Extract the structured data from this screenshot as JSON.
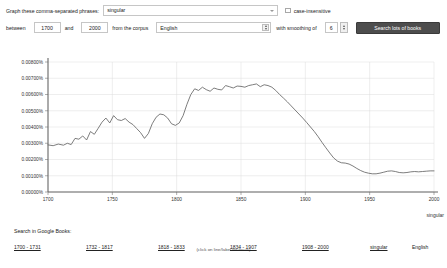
{
  "form": {
    "phrase_label": "Graph these comma-separated phrases:",
    "phrase_value": "singular",
    "phrase_placeholder": "singular",
    "case_insensitive_label": "case-insensitive",
    "between_label": "between",
    "start_year": "1700",
    "and_label": "and",
    "end_year": "2000",
    "corpus_label": "from the corpus",
    "corpus_value": "English",
    "smoothing_label": "with smoothing of",
    "smoothing_value": "6",
    "search_button_label": "Search lots of books"
  },
  "chart_data": {
    "type": "line",
    "title": "",
    "xlabel": "",
    "ylabel": "",
    "caption": "(click on line/label for focus)",
    "series_label": "singular",
    "grid": true,
    "legend_position": "right",
    "xlim": [
      1700,
      2000
    ],
    "ylim": [
      0.0,
      0.008
    ],
    "xticks": [
      "1700",
      "1750",
      "1800",
      "1850",
      "1900",
      "1950",
      "2000"
    ],
    "yticks": [
      "0.00000%",
      "0.00100%",
      "0.00200%",
      "0.00300%",
      "0.00400%",
      "0.00500%",
      "0.00600%",
      "0.00700%",
      "0.00800%"
    ],
    "series": [
      {
        "name": "singular",
        "color": "#666666",
        "x": [
          1700,
          1704,
          1708,
          1712,
          1715,
          1718,
          1721,
          1724,
          1727,
          1730,
          1733,
          1736,
          1739,
          1742,
          1745,
          1748,
          1751,
          1754,
          1757,
          1760,
          1763,
          1766,
          1769,
          1772,
          1775,
          1778,
          1781,
          1784,
          1787,
          1790,
          1793,
          1796,
          1799,
          1802,
          1805,
          1808,
          1811,
          1814,
          1817,
          1820,
          1823,
          1826,
          1829,
          1832,
          1835,
          1838,
          1841,
          1844,
          1847,
          1850,
          1853,
          1856,
          1859,
          1862,
          1865,
          1868,
          1871,
          1874,
          1877,
          1880,
          1883,
          1886,
          1889,
          1892,
          1895,
          1898,
          1901,
          1904,
          1907,
          1910,
          1913,
          1916,
          1919,
          1922,
          1925,
          1928,
          1931,
          1934,
          1937,
          1940,
          1943,
          1946,
          1949,
          1952,
          1955,
          1958,
          1961,
          1964,
          1967,
          1970,
          1973,
          1976,
          1979,
          1982,
          1985,
          1988,
          1991,
          1994,
          1997,
          2000
        ],
        "values": [
          0.0029,
          0.00285,
          0.00295,
          0.00288,
          0.003,
          0.00292,
          0.0033,
          0.00325,
          0.00345,
          0.0032,
          0.00372,
          0.00355,
          0.00392,
          0.0043,
          0.00455,
          0.00425,
          0.0047,
          0.00445,
          0.0044,
          0.00452,
          0.0043,
          0.00415,
          0.0039,
          0.00365,
          0.0033,
          0.0036,
          0.0042,
          0.0046,
          0.0048,
          0.00475,
          0.00455,
          0.0042,
          0.0041,
          0.00425,
          0.0047,
          0.0054,
          0.006,
          0.00635,
          0.00625,
          0.00645,
          0.0063,
          0.0062,
          0.0064,
          0.00632,
          0.00628,
          0.00655,
          0.00648,
          0.0064,
          0.00652,
          0.0065,
          0.00645,
          0.00655,
          0.0066,
          0.00665,
          0.00648,
          0.0066,
          0.00655,
          0.00645,
          0.00625,
          0.006,
          0.00578,
          0.00555,
          0.0053,
          0.00505,
          0.0048,
          0.00455,
          0.00428,
          0.004,
          0.00372,
          0.0034,
          0.00305,
          0.00272,
          0.0024,
          0.0021,
          0.0019,
          0.0018,
          0.00178,
          0.00172,
          0.0016,
          0.00145,
          0.00132,
          0.00122,
          0.00116,
          0.00112,
          0.00112,
          0.00116,
          0.00122,
          0.00128,
          0.0013,
          0.00126,
          0.0012,
          0.00118,
          0.0012,
          0.00124,
          0.00126,
          0.00124,
          0.00126,
          0.00128,
          0.0013,
          0.0013
        ]
      }
    ]
  },
  "footer": {
    "title": "Search in Google Books:",
    "links": [
      "1700 - 1731",
      "1732 - 1817",
      "1818 - 1833",
      "1834 - 1907",
      "1908 - 2000",
      "singular"
    ],
    "corpus": "English"
  }
}
